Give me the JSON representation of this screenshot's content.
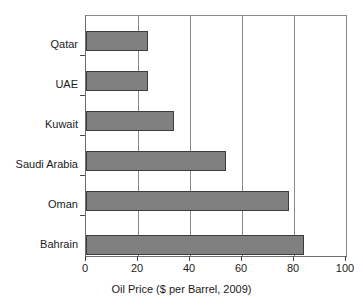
{
  "chart_data": {
    "type": "bar",
    "orientation": "horizontal",
    "title": "",
    "categories": [
      "Qatar",
      "UAE",
      "Kuwait",
      "Saudi Arabia",
      "Oman",
      "Bahrain"
    ],
    "values": [
      24,
      24,
      34,
      54,
      78,
      84
    ],
    "xlabel": "Oil Price ($ per Barrel, 2009)",
    "ylabel": "",
    "xlim": [
      0,
      100
    ],
    "xticks": [
      "0",
      "20",
      "40",
      "60",
      "80",
      "100"
    ],
    "xtick_values": [
      0,
      20,
      40,
      60,
      80,
      100
    ],
    "gridlines": [
      20,
      40,
      60,
      80
    ],
    "grid": true,
    "legend": false,
    "colors": {
      "bar_fill": "#808080",
      "bar_edge": "#3d3d3d",
      "grid": "#8a8a8a",
      "axis": "#4a4a4a",
      "background": "#ffffff",
      "text": "#1a1a1a"
    }
  }
}
